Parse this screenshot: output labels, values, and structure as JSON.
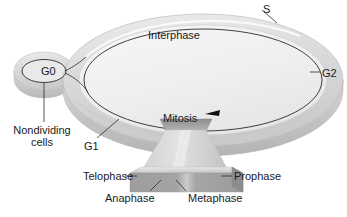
{
  "figure": {
    "type": "cell-cycle-wheel"
  },
  "labels": {
    "interphase": "Interphase",
    "s_phase": "S",
    "g2_phase": "G2",
    "g1_phase": "G1",
    "g0_phase": "G0",
    "nondividing": "Nondividing\ncells",
    "nondividing_line1": "Nondividing",
    "nondividing_line2": "cells",
    "mitosis": "Mitosis",
    "telophase": "Telophase",
    "prophase": "Prophase",
    "anaphase": "Anaphase",
    "metaphase": "Metaphase"
  },
  "colors": {
    "disc_top": "#f0f0f0",
    "disc_rim": "#d4d4d4",
    "disc_side": "#c4c4c4",
    "mitosis_wedge": "#9a9a9a",
    "prism_left": "#dcdcdc",
    "prism_right": "#c9c9c9",
    "base_front": "#9e9e9e",
    "base_top": "#cfcfcf",
    "outline": "#2b2b2b",
    "text": "#1a1a1a",
    "background": "#ffffff"
  },
  "cycle_order": [
    "G1",
    "S",
    "G2",
    "Mitosis"
  ],
  "mitosis_substages": [
    "Prophase",
    "Metaphase",
    "Anaphase",
    "Telophase"
  ],
  "arrow": {
    "name": "cycle-direction-arrow",
    "direction": "counterclockwise-toward-mitosis"
  }
}
